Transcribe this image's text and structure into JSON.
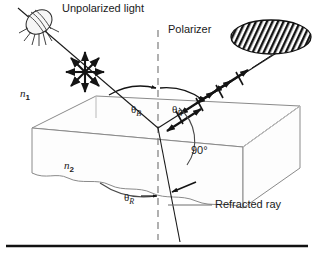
{
  "figure": {
    "width": 314,
    "height": 257,
    "background_color": "#ffffff",
    "ink_color": "#1a1a1a",
    "line_color": "#7a7a7a"
  },
  "labels": {
    "unpolarized_light": "Unpolarized light",
    "polarizer": "Polarizer",
    "medium_upper_index": "n",
    "medium_upper_subscript": "1",
    "medium_lower_index": "n",
    "medium_lower_subscript": "2",
    "theta_symbol": "θ",
    "brewster_subscript": "B",
    "refraction_subscript": "R",
    "right_angle": "90°",
    "refracted_ray": "Refracted ray"
  },
  "elements": {
    "light_source": "light-bulb-icon",
    "unpolarized_marker": "starburst-arrows-icon",
    "polarizer_disc": "hatched-ellipse-icon",
    "normal_line": "dashed-normal-line",
    "slab": "refracting-medium-slab",
    "baseline_rule": "bottom-rule"
  },
  "geometry": {
    "incident_ray_start": [
      36,
      22
    ],
    "incidence_point": [
      158,
      128
    ],
    "reflected_ray_end": [
      272,
      57
    ],
    "refracted_ray_end": [
      180,
      240
    ],
    "theta_b_incident_deg": 56,
    "theta_b_reflected_deg": 56,
    "reflected_to_refracted_deg": 90
  }
}
